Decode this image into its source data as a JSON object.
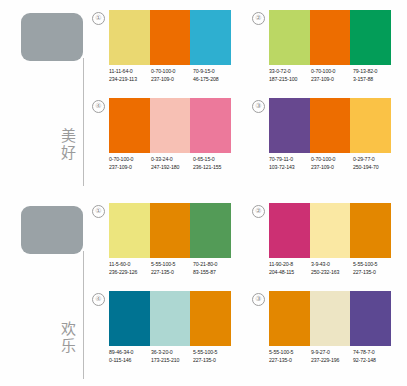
{
  "page": {
    "line_color": "#bcbcbc",
    "text_color": "#1d1d1d",
    "keyword_color": "#9a9a9a"
  },
  "sections": [
    {
      "keyword": "美好",
      "keyword_chars": [
        "美",
        "好"
      ],
      "key_swatch": "#9aa2a6",
      "groups": [
        {
          "number": "①",
          "swatches": [
            {
              "color": "#ead871",
              "cmyk": "11-11-64-0",
              "rgb": "234-219-113"
            },
            {
              "color": "#ed6d00",
              "cmyk": "0-70-100-0",
              "rgb": "237-109-0"
            },
            {
              "color": "#2eafd0",
              "cmyk": "70-9-15-0",
              "rgb": "46-175-208"
            }
          ]
        },
        {
          "number": "②",
          "swatches": [
            {
              "color": "#bbd764",
              "cmyk": "33-0-72-0",
              "rgb": "187-215-100"
            },
            {
              "color": "#ed6d00",
              "cmyk": "0-70-100-0",
              "rgb": "237-109-0"
            },
            {
              "color": "#039d58",
              "cmyk": "79-13-82-0",
              "rgb": "3-157-88"
            }
          ]
        },
        {
          "number": "④",
          "swatches": [
            {
              "color": "#ed6d00",
              "cmyk": "0-70-100-0",
              "rgb": "237-109-0"
            },
            {
              "color": "#f7c0b4",
              "cmyk": "0-33-24-0",
              "rgb": "247-192-180"
            },
            {
              "color": "#ec799b",
              "cmyk": "0-65-15-0",
              "rgb": "236-121-155"
            }
          ]
        },
        {
          "number": "③",
          "swatches": [
            {
              "color": "#67488f",
              "cmyk": "70-79-11-0",
              "rgb": "103-72-143"
            },
            {
              "color": "#ed6d00",
              "cmyk": "0-70-100-0",
              "rgb": "237-109-0"
            },
            {
              "color": "#fac246",
              "cmyk": "0-29-77-0",
              "rgb": "250-194-70"
            }
          ]
        }
      ]
    },
    {
      "keyword": "欢乐",
      "keyword_chars": [
        "欢",
        "乐"
      ],
      "key_swatch": "#9aa2a6",
      "groups": [
        {
          "number": "①",
          "swatches": [
            {
              "color": "#ece57e",
              "cmyk": "11-5-60-0",
              "rgb": "236-229-126"
            },
            {
              "color": "#e38700",
              "cmyk": "5-55-100-5",
              "rgb": "227-135-0"
            },
            {
              "color": "#539b57",
              "cmyk": "70-21-80-0",
              "rgb": "83-155-87"
            }
          ]
        },
        {
          "number": "②",
          "swatches": [
            {
              "color": "#cc3073",
              "cmyk": "11-90-20-8",
              "rgb": "204-48-115"
            },
            {
              "color": "#fae8a3",
              "cmyk": "3-9-43-0",
              "rgb": "250-232-163"
            },
            {
              "color": "#e38700",
              "cmyk": "5-55-100-5",
              "rgb": "227-135-0"
            }
          ]
        },
        {
          "number": "④",
          "swatches": [
            {
              "color": "#007392",
              "cmyk": "89-46-34-0",
              "rgb": "0-115-146"
            },
            {
              "color": "#add7d2",
              "cmyk": "36-3-20-0",
              "rgb": "173-215-210"
            },
            {
              "color": "#e38700",
              "cmyk": "5-55-100-5",
              "rgb": "227-135-0"
            }
          ]
        },
        {
          "number": "③",
          "swatches": [
            {
              "color": "#e38700",
              "cmyk": "5-55-100-5",
              "rgb": "227-135-0"
            },
            {
              "color": "#ede5c4",
              "cmyk": "9-9-27-0",
              "rgb": "237-229-196"
            },
            {
              "color": "#5c4892",
              "cmyk": "74-78-7-0",
              "rgb": "92-72-148"
            }
          ]
        }
      ]
    }
  ]
}
